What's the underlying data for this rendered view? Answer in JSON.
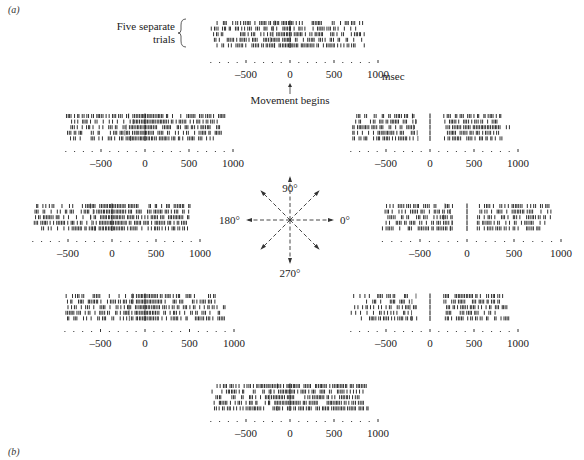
{
  "panel_labels": {
    "a": "(a)",
    "b": "(b)"
  },
  "annotations": {
    "trials_label_line1": "Five separate",
    "trials_label_line2": "trials",
    "movement_label": "Movement begins",
    "unit_label": "msec"
  },
  "compass": {
    "labels": {
      "deg90": "90°",
      "deg180": "180°",
      "deg0": "0°",
      "deg270": "270°"
    },
    "directions_deg": [
      0,
      45,
      90,
      135,
      180,
      225,
      270,
      315
    ]
  },
  "chart_data": {
    "type": "raster",
    "title": "",
    "xlabel": "msec",
    "x_range": [
      -900,
      1000
    ],
    "tick_labels": [
      "-500",
      "0",
      "500",
      "1000"
    ],
    "tick_values": [
      -500,
      0,
      500,
      1000
    ],
    "minor_tick_step": 100,
    "trials_per_direction": 5,
    "event_marker": "Movement begins at 0 msec",
    "panels": [
      {
        "direction_deg": 90,
        "position": "top",
        "baseline_rate": 0.55,
        "burst": {
          "from": -100,
          "to": 20,
          "rate": 1.0
        },
        "post_rate": 0.55,
        "gap": null
      },
      {
        "direction_deg": 135,
        "position": "upper-left",
        "baseline_rate": 0.5,
        "burst": {
          "from": -150,
          "to": 100,
          "rate": 1.0
        },
        "post_rate": 0.65,
        "gap": null
      },
      {
        "direction_deg": 45,
        "position": "upper-right",
        "baseline_rate": 0.55,
        "burst": null,
        "post_rate": 0.7,
        "gap": {
          "from": -150,
          "to": 150
        }
      },
      {
        "direction_deg": 180,
        "position": "left",
        "baseline_rate": 0.5,
        "burst": {
          "from": -150,
          "to": 150,
          "rate": 1.0
        },
        "post_rate": 0.65,
        "gap": null
      },
      {
        "direction_deg": 0,
        "position": "right",
        "baseline_rate": 0.55,
        "burst": null,
        "post_rate": 0.6,
        "gap": {
          "from": -150,
          "to": 100
        }
      },
      {
        "direction_deg": 225,
        "position": "lower-left",
        "baseline_rate": 0.5,
        "burst": {
          "from": -100,
          "to": 150,
          "rate": 1.0
        },
        "post_rate": 0.6,
        "gap": null
      },
      {
        "direction_deg": 315,
        "position": "lower-right",
        "baseline_rate": 0.45,
        "burst": null,
        "post_rate": 0.6,
        "gap": {
          "from": -150,
          "to": 150
        }
      },
      {
        "direction_deg": 270,
        "position": "bottom",
        "baseline_rate": 0.55,
        "burst": {
          "from": -200,
          "to": 50,
          "rate": 0.85
        },
        "post_rate": 0.7,
        "gap": null
      }
    ]
  }
}
